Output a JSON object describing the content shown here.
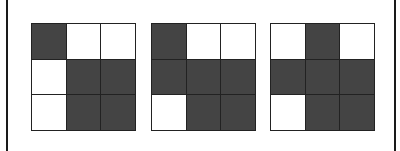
{
  "colors": {
    "filled": "#444444",
    "empty": "#ffffff",
    "border": "#222222"
  },
  "grids": [
    {
      "id": "grid-1",
      "cells": [
        [
          1,
          0,
          0
        ],
        [
          0,
          1,
          1
        ],
        [
          0,
          1,
          1
        ]
      ]
    },
    {
      "id": "grid-2",
      "cells": [
        [
          1,
          0,
          0
        ],
        [
          1,
          1,
          1
        ],
        [
          0,
          1,
          1
        ]
      ]
    },
    {
      "id": "grid-3",
      "cells": [
        [
          0,
          1,
          0
        ],
        [
          1,
          1,
          1
        ],
        [
          0,
          1,
          1
        ]
      ]
    }
  ]
}
